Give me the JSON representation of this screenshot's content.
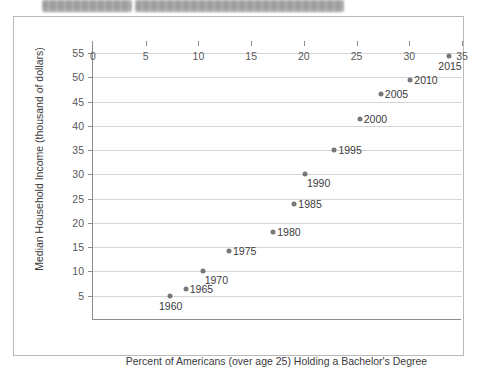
{
  "header": {
    "redacted_bars": [
      {
        "name": "redacted-title-bar-left"
      },
      {
        "name": "redacted-title-bar-right"
      }
    ]
  },
  "chart_data": {
    "type": "scatter",
    "title": "",
    "xlabel": "Percent of Americans (over age 25) Holding a Bachelor's Degree",
    "ylabel": "Median Household Income (thousand of dollars)",
    "xlim": [
      0,
      35
    ],
    "ylim": [
      0,
      57.5
    ],
    "xticks": [
      "0",
      "5",
      "10",
      "15",
      "20",
      "25",
      "30",
      "35"
    ],
    "xtick_values": [
      0,
      5,
      10,
      15,
      20,
      25,
      30,
      35
    ],
    "yticks": [
      "5",
      "10",
      "15",
      "20",
      "25",
      "30",
      "35",
      "40",
      "45",
      "50",
      "55"
    ],
    "ytick_values": [
      5,
      10,
      15,
      20,
      25,
      30,
      35,
      40,
      45,
      50,
      55
    ],
    "grid": "horizontal",
    "legend": "none",
    "points": [
      {
        "label": "1960",
        "x": 7.3,
        "y": 5.0,
        "label_pos": "below"
      },
      {
        "label": "1965",
        "x": 8.8,
        "y": 6.3,
        "label_pos": "right"
      },
      {
        "label": "1970",
        "x": 10.4,
        "y": 10.0,
        "label_pos": "below-right"
      },
      {
        "label": "1975",
        "x": 12.9,
        "y": 14.2,
        "label_pos": "right"
      },
      {
        "label": "1980",
        "x": 17.1,
        "y": 18.2,
        "label_pos": "right"
      },
      {
        "label": "1985",
        "x": 19.1,
        "y": 24.0,
        "label_pos": "right"
      },
      {
        "label": "1990",
        "x": 20.1,
        "y": 30.0,
        "label_pos": "below-right"
      },
      {
        "label": "1995",
        "x": 22.9,
        "y": 35.1,
        "label_pos": "right"
      },
      {
        "label": "2000",
        "x": 25.3,
        "y": 41.5,
        "label_pos": "right"
      },
      {
        "label": "2005",
        "x": 27.3,
        "y": 46.5,
        "label_pos": "right"
      },
      {
        "label": "2010",
        "x": 30.1,
        "y": 49.5,
        "label_pos": "right"
      },
      {
        "label": "2015",
        "x": 33.8,
        "y": 54.5,
        "label_pos": "below"
      }
    ],
    "colors": {
      "point": "#77777a",
      "grid": "#d5d5d5",
      "axis": "#8c8c8c",
      "text": "#3b3b3d"
    }
  }
}
